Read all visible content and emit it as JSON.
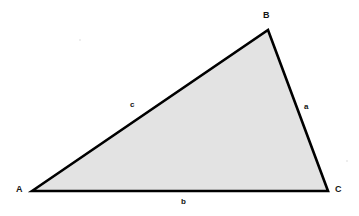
{
  "figure": {
    "canvas": {
      "width": 359,
      "height": 216,
      "background": "#ffffff"
    },
    "shape": {
      "kind": "triangle",
      "fill_color": "#e3e3e3",
      "stroke_color": "#000000",
      "stroke_width": 2.6,
      "points": "32,191 268,30 328,191"
    },
    "vertices": [
      {
        "id": "A",
        "label": "A",
        "x": 32,
        "y": 191,
        "label_x": 17,
        "label_y": 185
      },
      {
        "id": "B",
        "label": "B",
        "x": 268,
        "y": 30,
        "label_x": 263,
        "label_y": 12
      },
      {
        "id": "C",
        "label": "C",
        "x": 328,
        "y": 191,
        "label_x": 335,
        "label_y": 185
      }
    ],
    "sides": [
      {
        "id": "a",
        "label": "a",
        "from": "B",
        "to": "C",
        "label_x": 304,
        "label_y": 104
      },
      {
        "id": "b",
        "label": "b",
        "from": "A",
        "to": "C",
        "label_x": 181,
        "label_y": 199
      },
      {
        "id": "c",
        "label": "c",
        "from": "A",
        "to": "B",
        "label_x": 130,
        "label_y": 102
      }
    ]
  }
}
